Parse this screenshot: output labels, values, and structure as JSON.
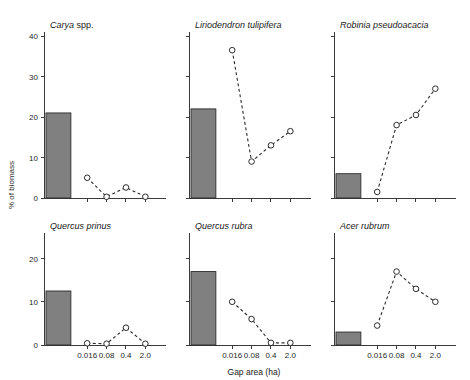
{
  "figure": {
    "ylabel": "% of biomass",
    "xlabel": "Gap area (ha)",
    "bar_color": "#808080",
    "line_color": "#2b2b2b",
    "marker_fill": "#ffffff",
    "background": "#ffffff"
  },
  "chart_data": [
    {
      "type": "bar",
      "title": "Carya spp.",
      "title_genus": "Carya",
      "title_rest": " spp.",
      "xlabel": "",
      "ylabel": "% of biomass",
      "ylim": [
        0,
        40
      ],
      "yticks": [
        0,
        10,
        20,
        30,
        40
      ],
      "ytick_labels": [
        "0",
        "10",
        "20",
        "30",
        "40"
      ],
      "categories": [
        "0.016",
        "0.08",
        "0.4",
        "2.0"
      ],
      "xtick_labels": [
        "",
        "",
        "",
        ""
      ],
      "grid": false,
      "legend": "none",
      "series": [
        {
          "name": "forest bar",
          "type": "bar",
          "values": [
            21.0
          ]
        },
        {
          "name": "gap line",
          "type": "line",
          "values": [
            5.0,
            0.3,
            2.6,
            0.3
          ]
        }
      ]
    },
    {
      "type": "bar",
      "title": "Liriodendron tulipifera",
      "title_genus": "Liriodendron tulipifera",
      "title_rest": "",
      "xlabel": "",
      "ylabel": "",
      "ylim": [
        0,
        40
      ],
      "yticks": [
        0,
        10,
        20,
        30,
        40
      ],
      "ytick_labels": [
        "",
        "",
        "",
        "",
        ""
      ],
      "categories": [
        "0.016",
        "0.08",
        "0.4",
        "2.0"
      ],
      "xtick_labels": [
        "",
        "",
        "",
        ""
      ],
      "grid": false,
      "legend": "none",
      "series": [
        {
          "name": "forest bar",
          "type": "bar",
          "values": [
            22.0
          ]
        },
        {
          "name": "gap line",
          "type": "line",
          "values": [
            36.5,
            9.0,
            13.0,
            16.5
          ]
        }
      ]
    },
    {
      "type": "bar",
      "title": "Robinia pseudoacacia",
      "title_genus": "Robinia pseudoacacia",
      "title_rest": "",
      "xlabel": "",
      "ylabel": "",
      "ylim": [
        0,
        40
      ],
      "yticks": [
        0,
        10,
        20,
        30,
        40
      ],
      "ytick_labels": [
        "",
        "",
        "",
        "",
        ""
      ],
      "categories": [
        "0.016",
        "0.08",
        "0.4",
        "2.0"
      ],
      "xtick_labels": [
        "",
        "",
        "",
        ""
      ],
      "grid": false,
      "legend": "none",
      "series": [
        {
          "name": "forest bar",
          "type": "bar",
          "values": [
            6.0
          ]
        },
        {
          "name": "gap line",
          "type": "line",
          "values": [
            1.5,
            18.0,
            20.5,
            27.0
          ]
        }
      ]
    },
    {
      "type": "bar",
      "title": "Quercus prinus",
      "title_genus": "Quercus prinus",
      "title_rest": "",
      "xlabel": "",
      "ylabel": "% of biomass",
      "ylim": [
        0,
        25
      ],
      "yticks": [
        0,
        10,
        20
      ],
      "ytick_labels": [
        "0",
        "10",
        "20"
      ],
      "categories": [
        "0.016",
        "0.08",
        "0.4",
        "2.0"
      ],
      "xtick_labels": [
        "0.016",
        "0.08",
        "0.4",
        "2.0"
      ],
      "grid": false,
      "legend": "none",
      "series": [
        {
          "name": "forest bar",
          "type": "bar",
          "values": [
            12.5
          ]
        },
        {
          "name": "gap line",
          "type": "line",
          "values": [
            0.4,
            0.3,
            4.0,
            0.3
          ]
        }
      ]
    },
    {
      "type": "bar",
      "title": "Quercus rubra",
      "title_genus": "Quercus rubra",
      "title_rest": "",
      "xlabel": "Gap area (ha)",
      "ylabel": "",
      "ylim": [
        0,
        25
      ],
      "yticks": [
        0,
        10,
        20
      ],
      "ytick_labels": [
        "",
        "",
        ""
      ],
      "categories": [
        "0.016",
        "0.08",
        "0.4",
        "2.0"
      ],
      "xtick_labels": [
        "0.016",
        "0.08",
        "0.4",
        "2.0"
      ],
      "grid": false,
      "legend": "none",
      "series": [
        {
          "name": "forest bar",
          "type": "bar",
          "values": [
            17.0
          ]
        },
        {
          "name": "gap line",
          "type": "line",
          "values": [
            10.0,
            6.0,
            0.5,
            0.5
          ]
        }
      ]
    },
    {
      "type": "bar",
      "title": "Acer rubrum",
      "title_genus": "Acer rubrum",
      "title_rest": "",
      "xlabel": "",
      "ylabel": "",
      "ylim": [
        0,
        25
      ],
      "yticks": [
        0,
        10,
        20
      ],
      "ytick_labels": [
        "",
        "",
        ""
      ],
      "categories": [
        "0.016",
        "0.08",
        "0.4",
        "2.0"
      ],
      "xtick_labels": [
        "0.016",
        "0.08",
        "0.4",
        "2.0"
      ],
      "grid": false,
      "legend": "none",
      "series": [
        {
          "name": "forest bar",
          "type": "bar",
          "values": [
            3.0
          ]
        },
        {
          "name": "gap line",
          "type": "line",
          "values": [
            4.5,
            17.0,
            13.0,
            10.0
          ]
        }
      ]
    }
  ]
}
